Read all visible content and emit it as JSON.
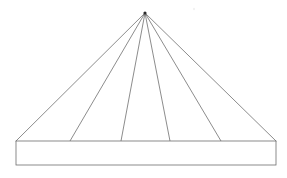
{
  "figure": {
    "title": "Fan of lines from apex to horizontal bar",
    "type": "line-drawing",
    "canvas": {
      "width": 287,
      "height": 178,
      "background": "#ffffff"
    },
    "stroke": {
      "color": "#6e6e6e",
      "dark_color": "#3a3a3a",
      "width": 0.8
    },
    "apex": {
      "name": "apex-point",
      "x": 145,
      "y": 13,
      "dot_radius": 1.6,
      "dot_color": "#2b2b2b"
    },
    "base_rectangle": {
      "name": "base-bar",
      "left": 16,
      "right": 276,
      "top": 141,
      "bottom": 165,
      "fill": "#ffffff",
      "stroke": "#6e6e6e"
    },
    "rays": [
      {
        "label": "ray-1-left-outer",
        "x_base": 16
      },
      {
        "label": "ray-2",
        "x_base": 70
      },
      {
        "label": "ray-3",
        "x_base": 121
      },
      {
        "label": "ray-4",
        "x_base": 170
      },
      {
        "label": "ray-5",
        "x_base": 221
      },
      {
        "label": "ray-6-right-outer",
        "x_base": 276
      }
    ],
    "speck": {
      "name": "stray-mark",
      "x": 194,
      "y": 9,
      "r": 1.2,
      "color": "#f2f2f2"
    }
  }
}
